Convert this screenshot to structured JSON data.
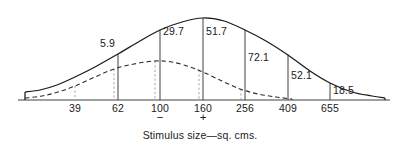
{
  "chart_data": {
    "type": "line",
    "title": "",
    "subtitle": "",
    "xlabel": "Stimulus size—sq. cms.",
    "ylabel": "",
    "grid": false,
    "legend_position": "none",
    "axis": {
      "x_start_px": 18,
      "x_end_px": 390,
      "baseline_px": 100,
      "categories": [
        "39",
        "62",
        "100",
        "160",
        "256",
        "409",
        "655"
      ],
      "tick_px": [
        75,
        118,
        160,
        203,
        245,
        288,
        330
      ]
    },
    "annotations": {
      "minus_sign": "−",
      "minus_under": "100",
      "plus_sign": "+",
      "plus_under": "160"
    },
    "series": [
      {
        "name": "solid-curve",
        "style": "solid",
        "peak_category": "160",
        "points": [
          {
            "x_px": 25,
            "y_px": 92
          },
          {
            "x_px": 40,
            "y_px": 90
          },
          {
            "x_px": 57,
            "y_px": 85
          },
          {
            "x_px": 75,
            "y_px": 77
          },
          {
            "x_px": 95,
            "y_px": 67
          },
          {
            "x_px": 118,
            "y_px": 54
          },
          {
            "x_px": 140,
            "y_px": 41
          },
          {
            "x_px": 160,
            "y_px": 30
          },
          {
            "x_px": 182,
            "y_px": 22
          },
          {
            "x_px": 203,
            "y_px": 18
          },
          {
            "x_px": 224,
            "y_px": 21
          },
          {
            "x_px": 245,
            "y_px": 30
          },
          {
            "x_px": 266,
            "y_px": 41
          },
          {
            "x_px": 288,
            "y_px": 55
          },
          {
            "x_px": 310,
            "y_px": 71
          },
          {
            "x_px": 330,
            "y_px": 83
          },
          {
            "x_px": 352,
            "y_px": 92
          },
          {
            "x_px": 372,
            "y_px": 96
          },
          {
            "x_px": 385,
            "y_px": 98
          }
        ]
      },
      {
        "name": "dashed-curve",
        "style": "dashed",
        "peak_category": "100",
        "points": [
          {
            "x_px": 25,
            "y_px": 98
          },
          {
            "x_px": 42,
            "y_px": 96
          },
          {
            "x_px": 58,
            "y_px": 92
          },
          {
            "x_px": 75,
            "y_px": 86
          },
          {
            "x_px": 95,
            "y_px": 77
          },
          {
            "x_px": 114,
            "y_px": 69
          },
          {
            "x_px": 134,
            "y_px": 64
          },
          {
            "x_px": 155,
            "y_px": 61
          },
          {
            "x_px": 172,
            "y_px": 62
          },
          {
            "x_px": 190,
            "y_px": 67
          },
          {
            "x_px": 203,
            "y_px": 72
          },
          {
            "x_px": 222,
            "y_px": 81
          },
          {
            "x_px": 240,
            "y_px": 89
          },
          {
            "x_px": 258,
            "y_px": 94
          },
          {
            "x_px": 276,
            "y_px": 97
          },
          {
            "x_px": 292,
            "y_px": 99
          }
        ]
      }
    ],
    "value_labels": [
      {
        "text": "5.9",
        "x_px": 100,
        "y_px": 47
      },
      {
        "text": "29.7",
        "x_px": 163,
        "y_px": 35
      },
      {
        "text": "51.7",
        "x_px": 206,
        "y_px": 35
      },
      {
        "text": "72.1",
        "x_px": 248,
        "y_px": 61
      },
      {
        "text": "52.1",
        "x_px": 291,
        "y_px": 79
      },
      {
        "text": "18.5",
        "x_px": 333,
        "y_px": 94
      }
    ],
    "reference_lines": [
      {
        "name": "tick-39",
        "category": "39",
        "style": "dashed",
        "x_px": 75,
        "y_top_px": 86,
        "y_bottom_px": 100
      },
      {
        "name": "tick-62a",
        "category": "62",
        "style": "dashed",
        "x_px": 114,
        "y_top_px": 69,
        "y_bottom_px": 100
      },
      {
        "name": "tick-62b",
        "category": "62",
        "style": "solid",
        "x_px": 118,
        "y_top_px": 54,
        "y_bottom_px": 100
      },
      {
        "name": "tick-100a",
        "category": "100",
        "style": "dashed",
        "x_px": 155,
        "y_top_px": 61,
        "y_bottom_px": 100
      },
      {
        "name": "tick-100b",
        "category": "100",
        "style": "solid",
        "x_px": 160,
        "y_top_px": 30,
        "y_bottom_px": 100
      },
      {
        "name": "tick-160a",
        "category": "160",
        "style": "dashed",
        "x_px": 199,
        "y_top_px": 70,
        "y_bottom_px": 100
      },
      {
        "name": "tick-160b",
        "category": "160",
        "style": "solid",
        "x_px": 203,
        "y_top_px": 18,
        "y_bottom_px": 100
      },
      {
        "name": "tick-256a",
        "category": "256",
        "style": "dashed",
        "x_px": 241,
        "y_top_px": 89,
        "y_bottom_px": 100
      },
      {
        "name": "tick-256b",
        "category": "256",
        "style": "solid",
        "x_px": 245,
        "y_top_px": 30,
        "y_bottom_px": 100
      },
      {
        "name": "tick-409",
        "category": "409",
        "style": "solid",
        "x_px": 288,
        "y_top_px": 55,
        "y_bottom_px": 100
      },
      {
        "name": "tick-655",
        "category": "655",
        "style": "solid",
        "x_px": 330,
        "y_top_px": 83,
        "y_bottom_px": 100
      }
    ],
    "end_caps": [
      {
        "name": "left-cap",
        "x_px": 25,
        "y_top_px": 92,
        "y_bottom_px": 100
      },
      {
        "name": "right-cap",
        "x_px": 385,
        "y_top_px": 98,
        "y_bottom_px": 100
      },
      {
        "name": "dashed-right-cap",
        "x_px": 292,
        "y_top_px": 99,
        "y_bottom_px": 100
      }
    ]
  },
  "caption": {
    "text": "Stimulus size—sq. cms.",
    "x_px": 200,
    "y_px": 139
  },
  "colors": {
    "ink": "#1a1a1a",
    "axis": "#2b2b2b",
    "guide": "#9a9a9a",
    "background": "#ffffff"
  }
}
